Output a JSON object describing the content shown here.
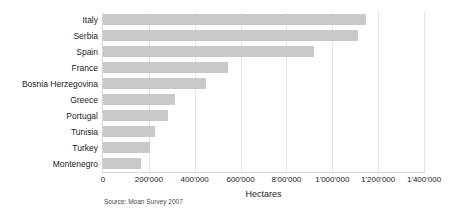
{
  "chart_data": {
    "type": "bar",
    "orientation": "horizontal",
    "title": "",
    "subtitle": "",
    "xlabel": "Hectares",
    "ylabel": "",
    "categories": [
      "Italy",
      "Serbia",
      "Spain",
      "France",
      "Bosnia Herzegovina",
      "Greece",
      "Portugal",
      "Tunisia",
      "Turkey",
      "Montenegro"
    ],
    "values": [
      1145000,
      1110000,
      920000,
      545000,
      450000,
      315000,
      283000,
      227000,
      205000,
      165000
    ],
    "xlim": [
      0,
      1400000
    ],
    "xticks": [
      0,
      200000,
      400000,
      600000,
      800000,
      1000000,
      1200000,
      1400000
    ],
    "xticklabels": [
      "0",
      "200'000",
      "400'000",
      "600'000",
      "8'00'000",
      "1'000'000",
      "1'200'000",
      "1'400'000"
    ],
    "grid": "vertical",
    "legend": "none",
    "bar_color": "#c9c9c9",
    "gridline_color": "#e3e3e3",
    "background_color": "#ffffff",
    "annotations": [
      "Source: Moan Survey 2007"
    ]
  },
  "footer": {
    "source_note": "Source: Moan Survey 2007"
  }
}
